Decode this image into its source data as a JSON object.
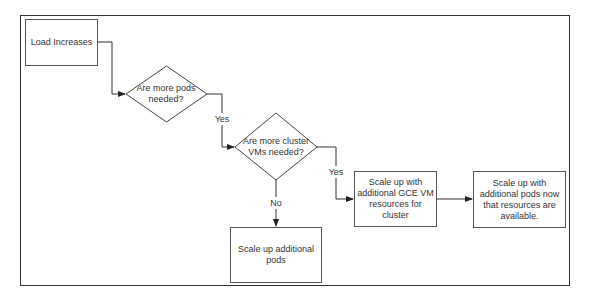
{
  "diagram": {
    "type": "flowchart",
    "nodes": {
      "load": {
        "shape": "rect",
        "text": "Load Increases"
      },
      "pods_needed": {
        "shape": "diamond",
        "line1": "Are more pods",
        "line2": "needed?"
      },
      "vms_needed": {
        "shape": "diamond",
        "line1": "Are more cluster",
        "line2": "VMs needed?"
      },
      "scale_vm": {
        "shape": "rect",
        "text": "Scale up with additional GCE VM resources for cluster"
      },
      "scale_pods_after": {
        "shape": "rect",
        "text": "Scale up with additional pods now that resources are available."
      },
      "scale_pods": {
        "shape": "rect",
        "text": "Scale up additional pods"
      }
    },
    "edges": [
      {
        "from": "load",
        "to": "pods_needed",
        "label": ""
      },
      {
        "from": "pods_needed",
        "to": "vms_needed",
        "label": "Yes"
      },
      {
        "from": "vms_needed",
        "to": "scale_vm",
        "label": "Yes"
      },
      {
        "from": "vms_needed",
        "to": "scale_pods",
        "label": "No"
      },
      {
        "from": "scale_vm",
        "to": "scale_pods_after",
        "label": ""
      }
    ],
    "edge_labels": {
      "yes1": "Yes",
      "yes2": "Yes",
      "no": "No"
    },
    "colors": {
      "stroke": "#333333",
      "text": "#333333",
      "background": "#ffffff"
    }
  }
}
